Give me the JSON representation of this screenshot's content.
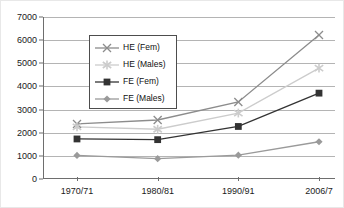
{
  "chart_data": {
    "type": "line",
    "title": "",
    "subtitle": "",
    "xlabel": "",
    "ylabel": "",
    "categories": [
      "1970/71",
      "1980/81",
      "1990/91",
      "2006/7"
    ],
    "series": [
      {
        "name": "HE (Fem)",
        "marker": "cross-x",
        "color": "#8c8c8c",
        "values": [
          2380,
          2550,
          3330,
          6220
        ]
      },
      {
        "name": "HE (Males)",
        "marker": "star",
        "color": "#cccccc",
        "values": [
          2250,
          2150,
          2850,
          4790
        ]
      },
      {
        "name": "FE (Fem)",
        "marker": "square",
        "color": "#333333",
        "values": [
          1730,
          1700,
          2270,
          3710
        ]
      },
      {
        "name": "FE (Males)",
        "marker": "diamond",
        "color": "#9a9a9a",
        "values": [
          1020,
          880,
          1030,
          1610
        ]
      }
    ],
    "ylim": [
      0,
      7000
    ],
    "y_ticks": [
      0,
      1000,
      2000,
      3000,
      4000,
      5000,
      6000,
      7000
    ],
    "y_tick_labels": [
      "0",
      "1000",
      "2000",
      "3000",
      "4000",
      "5000",
      "6000",
      "7000"
    ],
    "grid": true,
    "grid_axis": "y",
    "legend_position": "upper-left-inside",
    "legend_entries": [
      "HE (Fem)",
      "HE (Males)",
      "FE (Fem)",
      "FE (Males)"
    ],
    "annotations": [],
    "colors": {
      "grid": "#b4b4b4",
      "axis": "#6e6e6e",
      "text": "#1a1a1a",
      "background": "#ffffff",
      "legend_border": "#4d4d4d"
    }
  }
}
